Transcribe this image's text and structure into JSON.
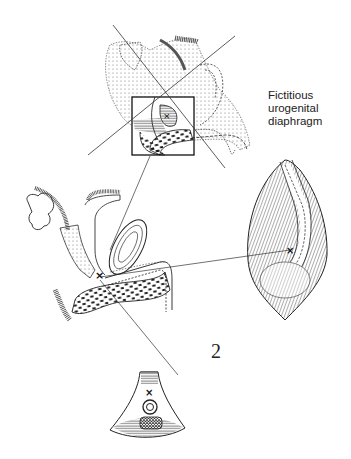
{
  "figure": {
    "number": "2",
    "callout": {
      "lines": [
        "Fictitious",
        "urogenital",
        "diaphragm"
      ]
    },
    "panels": [
      {
        "id": "top",
        "description": "sagittal section with square inset and crossing lines"
      },
      {
        "id": "left",
        "description": "sagittal pelvic section with marker x"
      },
      {
        "id": "right",
        "description": "perineal view with opened urethra and marker x"
      },
      {
        "id": "bottom",
        "description": "cross-section wedge with marker x"
      }
    ],
    "marker": "×"
  }
}
